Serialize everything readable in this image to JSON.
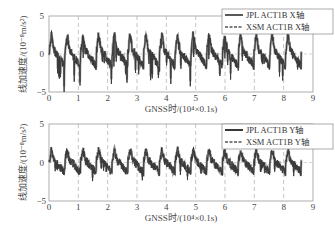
{
  "chart_data": [
    {
      "type": "line",
      "title": "",
      "xlabel": "GNSS时/(10⁴×0.1s)",
      "ylabel": "线加速度/(10⁻⁸m/s²)",
      "xlim": [
        0,
        9
      ],
      "ylim": [
        -5,
        5
      ],
      "xticks": [
        "0",
        "1",
        "2",
        "3",
        "4",
        "5",
        "6",
        "7",
        "8",
        "9"
      ],
      "yticks": [
        "-5",
        "0",
        "5"
      ],
      "grid": "dashed vertical at integer x",
      "legend_position": "upper right",
      "series": [
        {
          "name": "JPL ACT1B X轴",
          "style": "solid"
        },
        {
          "name": "XSM ACT1B X轴",
          "style": "dashed"
        }
      ],
      "description": "Periodic signal ~16 cycles over 0–8.6, peaks ~+2.7, troughs ~-2.5 to -4.3",
      "x_end": 8.6,
      "peak": 2.7,
      "trough_min": -4.3
    },
    {
      "type": "line",
      "title": "",
      "xlabel": "GNSS时/(10⁴×0.1s)",
      "ylabel": "线加速度/(10⁻⁸m/s²)",
      "xlim": [
        0,
        9
      ],
      "ylim": [
        -5,
        5
      ],
      "xticks": [
        "0",
        "1",
        "2",
        "3",
        "4",
        "5",
        "6",
        "7",
        "8",
        "9"
      ],
      "yticks": [
        "-5",
        "0",
        "5"
      ],
      "grid": "dashed vertical at integer x",
      "legend_position": "upper right",
      "series": [
        {
          "name": "JPL ACT1B Y轴",
          "style": "solid"
        },
        {
          "name": "XSM ACT1B Y轴",
          "style": "dashed"
        }
      ],
      "description": "Periodic signal ~16 cycles over 0–8.6, peaks ~+1.6, troughs ~-2.0",
      "x_end": 8.6,
      "peak": 1.6,
      "trough_min": -2.1
    }
  ],
  "top": {
    "ylabel": "线加速度/(10⁻⁸m/s²)",
    "xlabel": "GNSS时/(10⁴×0.1s)",
    "legend": [
      "JPL ACT1B X轴",
      "XSM ACT1B X轴"
    ],
    "yticks": [
      "5",
      "0",
      "−5"
    ]
  },
  "bottom": {
    "ylabel": "线加速度/(10⁻⁸m/s²)",
    "xlabel": "GNSS时/(10⁴×0.1s)",
    "legend": [
      "JPL ACT1B Y轴",
      "XSM ACT1B Y轴"
    ],
    "yticks": [
      "5",
      "0",
      "−5"
    ]
  },
  "xticks": [
    "0",
    "1",
    "2",
    "3",
    "4",
    "5",
    "6",
    "7",
    "8",
    "9"
  ]
}
